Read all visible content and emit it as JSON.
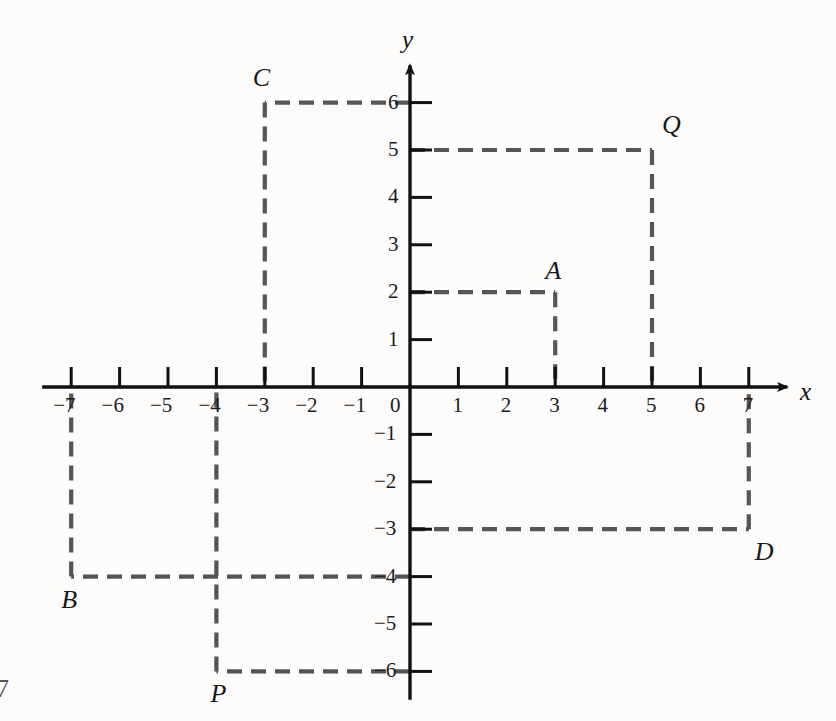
{
  "figure": {
    "background_color": "#fdfcfa",
    "axis_color": "#111111",
    "dash_color": "#555555"
  },
  "axes": {
    "x_axis_label": "x",
    "y_axis_label": "y",
    "origin_label": "0",
    "x_ticks": [
      {
        "value": -7,
        "label": "−7"
      },
      {
        "value": -6,
        "label": "−6"
      },
      {
        "value": -5,
        "label": "−5"
      },
      {
        "value": -4,
        "label": "−4"
      },
      {
        "value": -3,
        "label": "−3"
      },
      {
        "value": -2,
        "label": "−2"
      },
      {
        "value": -1,
        "label": "−1"
      },
      {
        "value": 1,
        "label": "1"
      },
      {
        "value": 2,
        "label": "2"
      },
      {
        "value": 3,
        "label": "3"
      },
      {
        "value": 4,
        "label": "4"
      },
      {
        "value": 5,
        "label": "5"
      },
      {
        "value": 6,
        "label": "6"
      },
      {
        "value": 7,
        "label": "7"
      }
    ],
    "y_ticks": [
      {
        "value": 6,
        "label": "6"
      },
      {
        "value": 5,
        "label": "5"
      },
      {
        "value": 4,
        "label": "4"
      },
      {
        "value": 3,
        "label": "3"
      },
      {
        "value": 2,
        "label": "2"
      },
      {
        "value": 1,
        "label": "1"
      },
      {
        "value": -1,
        "label": "−1"
      },
      {
        "value": -2,
        "label": "−2"
      },
      {
        "value": -3,
        "label": "−3"
      },
      {
        "value": -4,
        "label": "−4"
      },
      {
        "value": -5,
        "label": "−5"
      },
      {
        "value": -6,
        "label": "−6"
      }
    ],
    "x_range": [
      -7.6,
      8.0
    ],
    "y_range": [
      -6.6,
      7.0
    ]
  },
  "points": [
    {
      "name": "A",
      "label": "A",
      "x": 3,
      "y": 2,
      "label_pos": "above"
    },
    {
      "name": "B",
      "label": "B",
      "x": -7,
      "y": -4,
      "label_pos": "below"
    },
    {
      "name": "C",
      "label": "C",
      "x": -3,
      "y": 6,
      "label_pos": "above"
    },
    {
      "name": "D",
      "label": "D",
      "x": 7,
      "y": -3,
      "label_pos": "below"
    },
    {
      "name": "P",
      "label": "P",
      "x": -4,
      "y": -6,
      "label_pos": "below"
    },
    {
      "name": "Q",
      "label": "Q",
      "x": 5,
      "y": 5,
      "label_pos": "above"
    }
  ],
  "dashed_paths": [
    {
      "point": "A",
      "segments": [
        {
          "from": [
            0,
            2
          ],
          "to": [
            3,
            2
          ]
        },
        {
          "from": [
            3,
            2
          ],
          "to": [
            3,
            0
          ]
        }
      ]
    },
    {
      "point": "C",
      "segments": [
        {
          "from": [
            0,
            6
          ],
          "to": [
            -3,
            6
          ]
        },
        {
          "from": [
            -3,
            6
          ],
          "to": [
            -3,
            0
          ]
        }
      ]
    },
    {
      "point": "Q",
      "segments": [
        {
          "from": [
            0,
            5
          ],
          "to": [
            5,
            5
          ]
        },
        {
          "from": [
            5,
            5
          ],
          "to": [
            5,
            0
          ]
        }
      ]
    },
    {
      "point": "B",
      "segments": [
        {
          "from": [
            0,
            -4
          ],
          "to": [
            -7,
            -4
          ]
        },
        {
          "from": [
            -7,
            -4
          ],
          "to": [
            -7,
            0
          ]
        }
      ]
    },
    {
      "point": "D",
      "segments": [
        {
          "from": [
            0,
            -3
          ],
          "to": [
            7,
            -3
          ]
        },
        {
          "from": [
            7,
            -3
          ],
          "to": [
            7,
            0
          ]
        }
      ]
    },
    {
      "point": "P",
      "segments": [
        {
          "from": [
            0,
            -6
          ],
          "to": [
            -4,
            -6
          ]
        },
        {
          "from": [
            -4,
            -6
          ],
          "to": [
            -4,
            0
          ]
        }
      ]
    }
  ],
  "page_artifact": {
    "text": "7"
  }
}
